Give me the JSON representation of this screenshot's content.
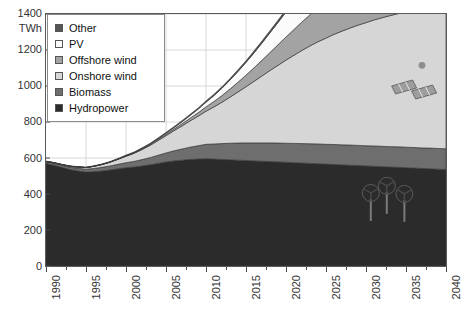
{
  "chart_data": {
    "type": "area",
    "title": "",
    "subtitle": "",
    "xlabel": "",
    "ylabel": "TWh",
    "stacked": true,
    "grid": true,
    "legend_position": "top-left",
    "xlim": [
      1990,
      2040
    ],
    "ylim": [
      0,
      1400
    ],
    "y_ticks": [
      0,
      200,
      400,
      600,
      800,
      1000,
      1200,
      1400
    ],
    "x_ticks": [
      1990,
      1995,
      2000,
      2005,
      2010,
      2015,
      2020,
      2025,
      2030,
      2035,
      2040
    ],
    "x_tick_labels": [
      "1990",
      "1995",
      "2000",
      "2005",
      "2010",
      "2015",
      "2020",
      "2025",
      "2030",
      "2035",
      "2040"
    ],
    "y_tick_labels": [
      "0",
      "200",
      "400",
      "600",
      "800",
      "1000",
      "1200",
      "1400"
    ],
    "x": [
      1990,
      1991,
      1992,
      1993,
      1994,
      1995,
      1996,
      1997,
      1998,
      1999,
      2000,
      2001,
      2002,
      2003,
      2004,
      2005,
      2006,
      2007,
      2008,
      2009,
      2010,
      2011,
      2012,
      2013,
      2014,
      2015,
      2016,
      2017,
      2018,
      2019,
      2020,
      2021,
      2022,
      2023,
      2024,
      2025,
      2026,
      2027,
      2028,
      2029,
      2030,
      2031,
      2032,
      2033,
      2034,
      2035,
      2036,
      2037,
      2038,
      2039,
      2040
    ],
    "series": [
      {
        "name": "Hydropower",
        "color": "#2b2b2b",
        "values": [
          570,
          560,
          548,
          536,
          528,
          522,
          524,
          528,
          534,
          540,
          546,
          550,
          556,
          562,
          570,
          578,
          584,
          588,
          592,
          594,
          596,
          594,
          592,
          590,
          588,
          586,
          584,
          582,
          580,
          578,
          576,
          574,
          572,
          570,
          568,
          566,
          564,
          562,
          560,
          558,
          556,
          554,
          552,
          550,
          548,
          546,
          544,
          542,
          540,
          538,
          536
        ]
      },
      {
        "name": "Biomass",
        "color": "#6e6e6e",
        "values": [
          10,
          11,
          12,
          13,
          15,
          16,
          18,
          20,
          22,
          25,
          28,
          31,
          35,
          40,
          45,
          50,
          56,
          62,
          68,
          74,
          80,
          84,
          88,
          92,
          95,
          98,
          100,
          102,
          104,
          105,
          106,
          107,
          108,
          109,
          110,
          110,
          111,
          111,
          112,
          112,
          112,
          113,
          113,
          113,
          114,
          114,
          114,
          114,
          115,
          115,
          115
        ]
      },
      {
        "name": "Onshore wind",
        "color": "#d6d6d6",
        "values": [
          1,
          2,
          3,
          5,
          7,
          9,
          12,
          16,
          21,
          28,
          36,
          45,
          56,
          68,
          82,
          96,
          112,
          128,
          146,
          164,
          184,
          206,
          230,
          256,
          284,
          312,
          342,
          372,
          402,
          432,
          462,
          490,
          518,
          544,
          568,
          590,
          612,
          632,
          650,
          668,
          684,
          700,
          714,
          728,
          740,
          752,
          762,
          772,
          782,
          790,
          798
        ]
      },
      {
        "name": "Offshore wind",
        "color": "#a3a3a3",
        "values": [
          0,
          0,
          0,
          0,
          0,
          0,
          0,
          0,
          0,
          1,
          1,
          2,
          3,
          4,
          5,
          7,
          9,
          12,
          15,
          19,
          24,
          30,
          37,
          45,
          54,
          64,
          75,
          87,
          100,
          114,
          128,
          143,
          158,
          173,
          188,
          202,
          216,
          229,
          242,
          254,
          266,
          277,
          288,
          298,
          308,
          317,
          326,
          334,
          342,
          349,
          356
        ]
      },
      {
        "name": "PV",
        "color": "#fbfbfb",
        "values": [
          0,
          0,
          0,
          0,
          0,
          0,
          0,
          0,
          0,
          0,
          1,
          1,
          2,
          3,
          4,
          6,
          8,
          11,
          15,
          20,
          26,
          33,
          41,
          50,
          60,
          71,
          83,
          96,
          110,
          124,
          139,
          154,
          169,
          184,
          199,
          214,
          228,
          242,
          256,
          269,
          282,
          294,
          306,
          317,
          328,
          338,
          348,
          357,
          366,
          374,
          382
        ]
      },
      {
        "name": "Other",
        "color": "#555555",
        "values": [
          2,
          2,
          2,
          2,
          2,
          2,
          3,
          3,
          3,
          3,
          4,
          4,
          4,
          4,
          5,
          5,
          5,
          6,
          6,
          6,
          7,
          7,
          8,
          8,
          9,
          9,
          10,
          11,
          11,
          12,
          13,
          13,
          14,
          14,
          15,
          15,
          16,
          16,
          17,
          17,
          18,
          18,
          19,
          19,
          20,
          20,
          21,
          21,
          22,
          22,
          23
        ]
      }
    ],
    "legend_entries": [
      {
        "label": "Other",
        "color": "#555555"
      },
      {
        "label": "PV",
        "color": "#fbfbfb"
      },
      {
        "label": "Offshore wind",
        "color": "#a3a3a3"
      },
      {
        "label": "Onshore wind",
        "color": "#d6d6d6"
      },
      {
        "label": "Biomass",
        "color": "#6e6e6e"
      },
      {
        "label": "Hydropower",
        "color": "#2b2b2b"
      }
    ],
    "annotations": [
      {
        "name": "wind-turbines-illustration",
        "x": 2033,
        "y": 300
      },
      {
        "name": "solar-panels-illustration",
        "x": 2035,
        "y": 1020
      },
      {
        "name": "sun-illustration",
        "x": 2037,
        "y": 1110
      }
    ]
  },
  "axis": {
    "y_unit": "TWh"
  }
}
